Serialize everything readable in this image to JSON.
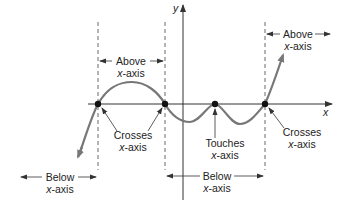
{
  "diagram": {
    "type": "polynomial-graph-annotation",
    "axes": {
      "x_label": "x",
      "y_label": "y"
    },
    "labels": {
      "above_left": {
        "line1": "Above",
        "line2": "x-axis"
      },
      "above_right": {
        "line1": "Above",
        "line2": "x-axis"
      },
      "below_left": {
        "line1": "Below",
        "line2": "x-axis"
      },
      "below_middle": {
        "line1": "Below",
        "line2": "x-axis"
      },
      "crosses_left": {
        "line1": "Crosses",
        "line2": "x-axis"
      },
      "crosses_right": {
        "line1": "Crosses",
        "line2": "x-axis"
      },
      "touches": {
        "line1": "Touches",
        "line2": "x-axis"
      }
    },
    "zeros": [
      {
        "behavior": "crosses"
      },
      {
        "behavior": "crosses"
      },
      {
        "behavior": "touches"
      },
      {
        "behavior": "crosses"
      }
    ],
    "colors": {
      "curve": "#777777",
      "axis": "#333333",
      "dot": "#111111",
      "text": "#222222"
    }
  }
}
